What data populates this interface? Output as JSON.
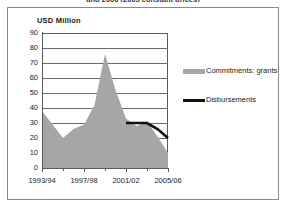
{
  "figure": {
    "supertitle": "and 2006 (2005 constant prices)",
    "axis_title": "USD Million",
    "frame_color": "#8a8a8a"
  },
  "legend": {
    "position": "right",
    "entries": [
      {
        "label": "Commitments: grants",
        "color": "#a6a6a6",
        "marker": "area-swatch"
      },
      {
        "label": "Disbursements",
        "color": "#111111",
        "marker": "line-swatch"
      }
    ]
  },
  "chart_data": {
    "type": "area",
    "title": "and 2006 (2005 constant prices)",
    "xlabel": "",
    "ylabel": "USD Million",
    "ylim": [
      0,
      90
    ],
    "ytick_step": 10,
    "yticks": [
      90,
      80,
      70,
      60,
      50,
      40,
      30,
      20,
      10,
      0
    ],
    "grid": true,
    "grid_axis": "y",
    "x": [
      "1993/94",
      "1994/95",
      "1995/96",
      "1996/97",
      "1997/98",
      "1998/99",
      "1999/00",
      "2000/01",
      "2001/02",
      "2002/03",
      "2003/04",
      "2004/05",
      "2005/06"
    ],
    "xtick_labels": [
      "1993/94",
      "1997/98",
      "2001/02",
      "2005/06"
    ],
    "xtick_label_indices": [
      0,
      4,
      8,
      12
    ],
    "series": [
      {
        "name": "Commitments: grants",
        "type": "area",
        "color": "#a6a6a6",
        "values": [
          38,
          29,
          20,
          26,
          29,
          42,
          76,
          52,
          33,
          28,
          31,
          21,
          10
        ]
      },
      {
        "name": "Disbursements",
        "type": "line",
        "color": "#111111",
        "x_start_index": 8,
        "values": [
          null,
          null,
          null,
          null,
          null,
          null,
          null,
          null,
          30,
          30,
          30,
          26,
          20
        ]
      }
    ]
  }
}
